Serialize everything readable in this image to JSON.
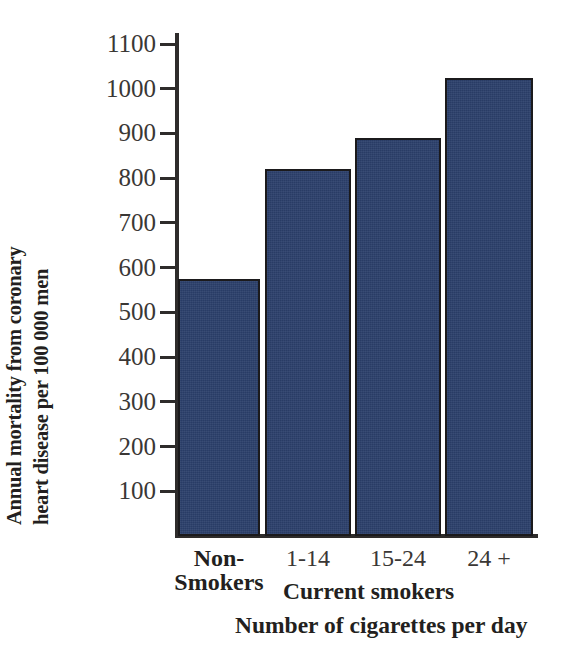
{
  "chart_data": {
    "type": "bar",
    "title": "",
    "subtitle": "",
    "categories": [
      "Non-Smokers",
      "1-14",
      "15-24",
      "24 +"
    ],
    "values": [
      575,
      820,
      890,
      1025
    ],
    "xlabel": "Number of cigarettes per day",
    "ylabel": "Annual mortality from coronary heart disease per 100 000 men",
    "ylim": [
      0,
      1100
    ],
    "xlim": [
      0,
      4
    ],
    "grid": false,
    "legend": null,
    "bar_color": "#2b3f6b",
    "bar_edge_color": "#1b1a1c",
    "axis_color": "#2e2c2b",
    "background": "#ffffff",
    "ytick_values": [
      100,
      200,
      300,
      400,
      500,
      600,
      700,
      800,
      900,
      1000,
      1100
    ],
    "ytick_labels": [
      "100",
      "200",
      "300",
      "400",
      "500",
      "600",
      "700",
      "800",
      "900",
      "1000",
      "1100"
    ],
    "annotations": [
      "Current smokers",
      "Number of cigarettes per day"
    ]
  },
  "axis": {
    "y_title_line1": "Annual mortality from coronary",
    "y_title_line2": "heart disease per 100 000 men"
  },
  "xcategories": [
    {
      "line1": "Non-",
      "line2": "Smokers",
      "bold": true
    },
    {
      "line1": "1-14",
      "line2": "",
      "bold": false
    },
    {
      "line1": "15-24",
      "line2": "",
      "bold": false
    },
    {
      "line1": "24 +",
      "line2": "",
      "bold": false
    }
  ],
  "captions": {
    "group_label": "Current smokers",
    "axis_label": "Number of cigarettes per day"
  }
}
